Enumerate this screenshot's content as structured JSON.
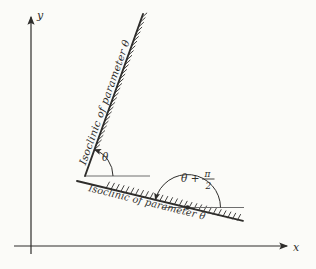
{
  "figure": {
    "colors": {
      "background": "#fbfbf8",
      "ink": "#2e2d2b",
      "thin_line": "#6e6e6e"
    },
    "axes": {
      "x_label": "x",
      "y_label": "y"
    },
    "labels": {
      "isoclinic_steep": "Isoclinic of parameter θ",
      "isoclinic_shallow": "Isoclinic of parameter θ",
      "theta": "θ",
      "theta_plus": "θ +",
      "pi_numerator": "π",
      "denominator_2": "2"
    }
  }
}
